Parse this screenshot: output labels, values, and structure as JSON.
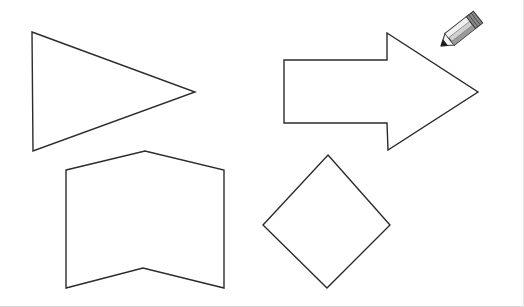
{
  "canvas": {
    "title": "Shape Drawing Canvas",
    "width": 524,
    "height": 307,
    "background_color": "#ffffff",
    "border_color": "#d9d9d9",
    "stroke_color": "#2b2b2b",
    "fill_color": "#ffffff",
    "stroke_width": 1.4
  },
  "shapes": [
    {
      "name": "triangle",
      "label": "Triangle",
      "sides": 3,
      "points": "32,32 195,92 33,151",
      "bbox": [
        32,
        32,
        163,
        119
      ]
    },
    {
      "name": "right-arrow",
      "label": "Right Arrow",
      "sides": 7,
      "points": "284,60 387,60 387,33 478,92 388,150 387,123 284,123",
      "bbox": [
        284,
        33,
        194,
        117
      ]
    },
    {
      "name": "banner-pentagon",
      "label": "Banner Chevron",
      "sides": 6,
      "points": "66,170 145,151 224,170 224,288 143,268 66,288",
      "bbox": [
        66,
        151,
        158,
        137
      ]
    },
    {
      "name": "diamond",
      "label": "Diamond",
      "sides": 4,
      "points": "328,155 390,225 327,288 263,225",
      "bbox": [
        263,
        155,
        127,
        133
      ]
    }
  ],
  "cursor": {
    "name": "pencil-cursor",
    "label": "Pencil",
    "tip_x": 441,
    "tip_y": 46,
    "angle_deg": -38,
    "body_color": "#d0d0d0",
    "highlight_color": "#f0f0f0",
    "shade_color": "#9a9a9a",
    "ferrule_color": "#8c8c8c",
    "tip_color": "#1a1a1a",
    "outline_color": "#3a3a3a"
  }
}
